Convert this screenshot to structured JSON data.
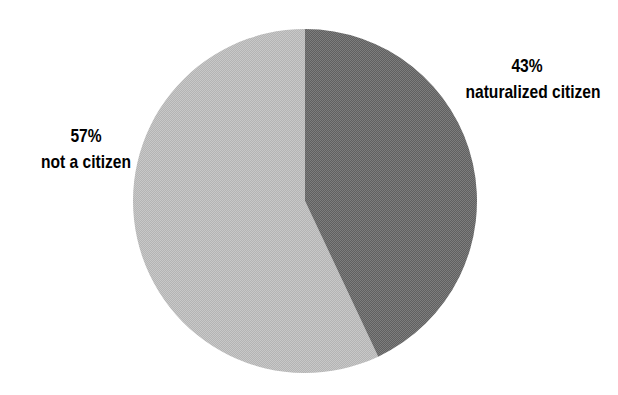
{
  "chart_data": {
    "type": "pie",
    "title": "",
    "subtitle": "",
    "xlabel": "",
    "ylabel": "",
    "legend_position": "none",
    "grid": false,
    "units": "percent",
    "start_angle_deg": 0,
    "direction": "clockwise",
    "categories": [
      "naturalized citizen",
      "not a citizen"
    ],
    "values": [
      43,
      57
    ],
    "labels": [
      "43%",
      "57%"
    ],
    "colors": [
      "#6b6b6b",
      "#bdbdbd"
    ],
    "slices": [
      {
        "name": "naturalized citizen",
        "percent_label": "43%",
        "value": 43,
        "color": "#6b6b6b",
        "start_angle_deg": 0,
        "sweep_angle_deg": 154.8
      },
      {
        "name": "not a citizen",
        "percent_label": "57%",
        "value": 57,
        "color": "#bdbdbd",
        "start_angle_deg": 154.8,
        "sweep_angle_deg": 205.2
      }
    ]
  },
  "geometry": {
    "center_x": 305,
    "center_y": 201,
    "radius": 172
  },
  "labels": {
    "naturalized": {
      "percent": "43%",
      "name": "naturalized citizen"
    },
    "not_citizen": {
      "percent": "57%",
      "name": "not a citizen"
    }
  },
  "colors": {
    "background": "#ffffff",
    "slice_dark": "#6b6b6b",
    "slice_light": "#bdbdbd",
    "text": "#000000"
  }
}
